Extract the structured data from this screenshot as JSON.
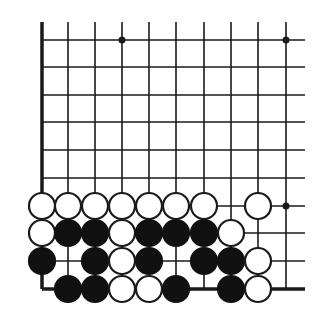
{
  "diagram": {
    "type": "go-board-corner",
    "colors": {
      "background": "#ffffff",
      "line": "#1a1a1a",
      "black_stone": "#111111",
      "white_stone_fill": "#ffffff",
      "white_stone_stroke": "#1a1a1a"
    },
    "grid": {
      "columns_x": [
        42,
        68,
        95,
        122,
        149,
        176,
        204,
        231,
        258,
        286
      ],
      "rows_y": [
        40,
        67,
        95,
        122,
        150,
        178,
        206,
        233,
        261,
        289
      ],
      "line_top_y": 22,
      "line_right_x": 305,
      "left_edge": "thick",
      "bottom_edge": "thick"
    },
    "star_points": [
      {
        "col": 4,
        "row": 1
      },
      {
        "col": 10,
        "row": 1
      },
      {
        "col": 10,
        "row": 7
      }
    ],
    "stones": [
      {
        "color": "white",
        "col": 1,
        "row": 7
      },
      {
        "color": "white",
        "col": 2,
        "row": 7
      },
      {
        "color": "white",
        "col": 3,
        "row": 7
      },
      {
        "color": "white",
        "col": 4,
        "row": 7
      },
      {
        "color": "white",
        "col": 5,
        "row": 7
      },
      {
        "color": "white",
        "col": 6,
        "row": 7
      },
      {
        "color": "white",
        "col": 7,
        "row": 7
      },
      {
        "color": "white",
        "col": 9,
        "row": 7
      },
      {
        "color": "white",
        "col": 1,
        "row": 8
      },
      {
        "color": "black",
        "col": 2,
        "row": 8
      },
      {
        "color": "black",
        "col": 3,
        "row": 8
      },
      {
        "color": "white",
        "col": 4,
        "row": 8
      },
      {
        "color": "black",
        "col": 5,
        "row": 8
      },
      {
        "color": "black",
        "col": 6,
        "row": 8
      },
      {
        "color": "black",
        "col": 7,
        "row": 8
      },
      {
        "color": "white",
        "col": 8,
        "row": 8
      },
      {
        "color": "black",
        "col": 1,
        "row": 9
      },
      {
        "color": "black",
        "col": 3,
        "row": 9
      },
      {
        "color": "white",
        "col": 4,
        "row": 9
      },
      {
        "color": "black",
        "col": 5,
        "row": 9
      },
      {
        "color": "black",
        "col": 7,
        "row": 9
      },
      {
        "color": "black",
        "col": 8,
        "row": 9
      },
      {
        "color": "white",
        "col": 9,
        "row": 9
      },
      {
        "color": "black",
        "col": 2,
        "row": 10
      },
      {
        "color": "black",
        "col": 3,
        "row": 10
      },
      {
        "color": "white",
        "col": 4,
        "row": 10
      },
      {
        "color": "white",
        "col": 5,
        "row": 10
      },
      {
        "color": "black",
        "col": 6,
        "row": 10
      },
      {
        "color": "black",
        "col": 8,
        "row": 10
      },
      {
        "color": "white",
        "col": 9,
        "row": 10
      }
    ],
    "stone_radius": 13
  }
}
